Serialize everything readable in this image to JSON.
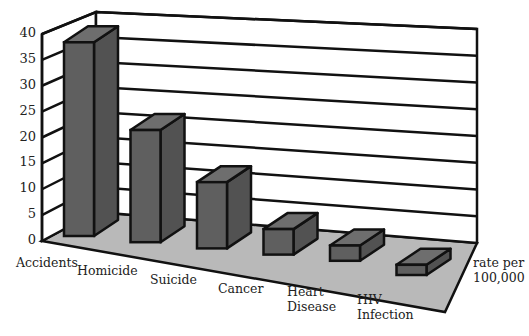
{
  "chart_data": {
    "type": "bar",
    "style": "3d-column",
    "title": "",
    "xlabel": "",
    "ylabel": "rate per 100,000",
    "categories": [
      "Accidents",
      "Homicide",
      "Suicide",
      "Cancer",
      "Heart Disease",
      "HIV Infection"
    ],
    "values": [
      38,
      22,
      13,
      5,
      3,
      2
    ],
    "ylim": [
      0,
      40
    ],
    "yticks": [
      "0",
      "5",
      "10",
      "15",
      "20",
      "25",
      "30",
      "35",
      "40"
    ],
    "grid": true,
    "legend": null,
    "axis_label_text": "rate per\n100,000",
    "category_labels": [
      "Accidents",
      "Homicide",
      "Suicide",
      "Cancer",
      "Heart\nDisease",
      "HIV\nInfection"
    ],
    "colors": {
      "bar_front": "#5f5f5f",
      "bar_side": "#525252",
      "bar_top": "#6e6e6e",
      "floor": "#b9b9b9",
      "wall": "#ffffff",
      "lines": "#111111"
    }
  }
}
